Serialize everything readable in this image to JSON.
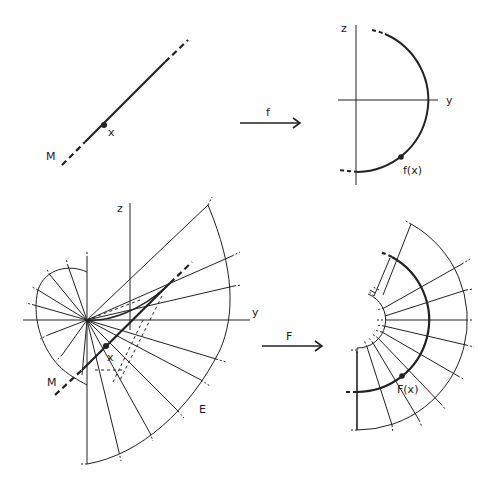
{
  "figure": {
    "header_text": "",
    "panel_top_left": {
      "manifold_label": "M",
      "point_label": "x"
    },
    "arrow_f": {
      "label": "f"
    },
    "panel_top_right": {
      "axis_vertical_label": "z",
      "axis_horizontal_label": "y",
      "image_point_label": "f(x)"
    },
    "panel_bottom_left": {
      "axis_vertical_label": "z",
      "axis_horizontal_label": "y",
      "manifold_label": "M",
      "point_label": "x",
      "surface_label": "E"
    },
    "arrow_F": {
      "label": "F"
    },
    "panel_bottom_right": {
      "image_point_label": "F(x)"
    },
    "colors": {
      "ink": "#222222",
      "background": "#ffffff"
    }
  }
}
